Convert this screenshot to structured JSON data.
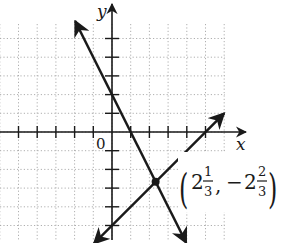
{
  "chart_data": {
    "type": "line",
    "title": "",
    "xlabel": "x",
    "ylabel": "y",
    "origin_label": "0",
    "xlim": [
      -6,
      6
    ],
    "ylim": [
      -6,
      6
    ],
    "grid": true,
    "tick_spacing": 1,
    "x_ticks": [
      -5,
      -4,
      -3,
      -2,
      -1,
      1,
      2,
      3,
      4,
      5
    ],
    "y_ticks": [
      -5,
      -4,
      -3,
      -2,
      -1,
      1,
      2,
      3,
      4,
      5
    ],
    "series": [
      {
        "name": "line-1",
        "equation": "y = -2x + 2",
        "slope": -2,
        "intercept": 2,
        "x": [
          -1.97,
          3.97
        ],
        "y": [
          5.93,
          -5.93
        ]
      },
      {
        "name": "line-2",
        "equation": "y = x - 5",
        "slope": 1,
        "intercept": -5,
        "x": [
          -0.97,
          6.0
        ],
        "y": [
          -5.97,
          1.0
        ]
      }
    ],
    "annotations": [
      {
        "type": "point",
        "x": 2.3333,
        "y": -2.6667,
        "label": {
          "open": "(",
          "x_whole": "2",
          "x_num": "1",
          "x_den": "3",
          "sep": ",",
          "y_sign": "−",
          "y_whole": "2",
          "y_num": "2",
          "y_den": "3",
          "close": ")"
        }
      }
    ]
  }
}
